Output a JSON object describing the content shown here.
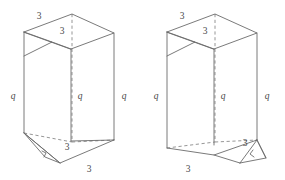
{
  "figure": {
    "caption": "",
    "stroke_color": "#6b6b6b",
    "hidden_stroke_color": "#8a8a8a",
    "background_color": "#ffffff",
    "label_color": "#4a4a4a"
  },
  "prisms": [
    {
      "id": "left-prism",
      "name": "left-prism",
      "flap_side": "bottom-left",
      "labels": {
        "top_left_edge": "3",
        "top_inner_edge": "3",
        "left_vertical": "q",
        "middle_vertical": "q",
        "right_vertical": "q",
        "bottom_inner_edge": "3",
        "bottom_front_edge": "3"
      }
    },
    {
      "id": "right-prism",
      "name": "right-prism",
      "flap_side": "bottom-right",
      "labels": {
        "top_left_edge": "3",
        "top_inner_edge": "3",
        "left_vertical": "q",
        "middle_vertical": "q",
        "right_vertical": "q",
        "bottom_inner_edge": "3",
        "bottom_front_edge": "3"
      }
    }
  ]
}
